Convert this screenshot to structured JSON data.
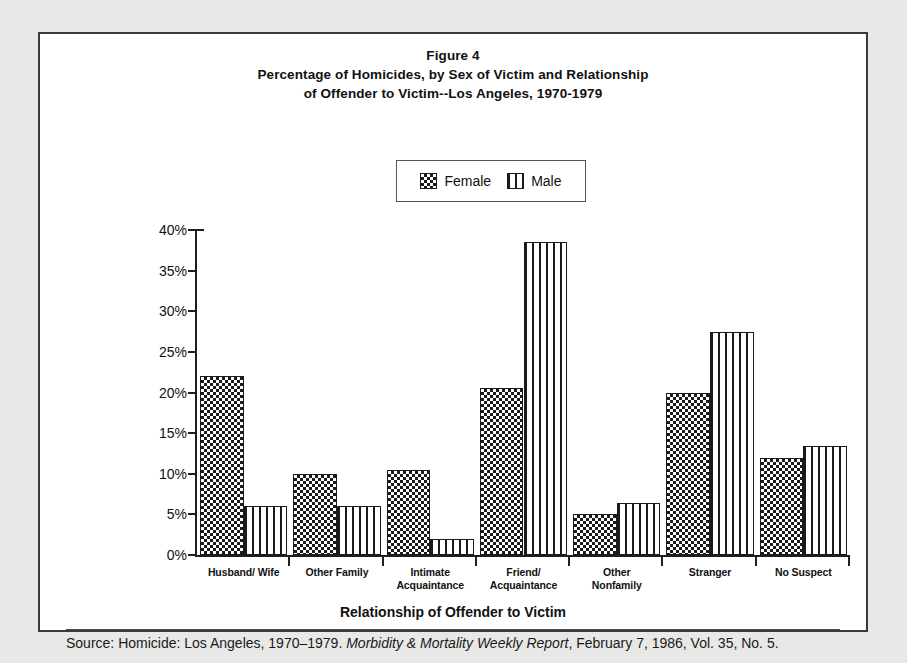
{
  "figure": {
    "title_lines": [
      "Figure 4",
      "Percentage of Homicides, by Sex of Victim and Relationship",
      "of Offender to Victim--Los Angeles, 1970-1979"
    ],
    "xaxis_title": "Relationship of Offender to Victim",
    "source_prefix": "Source: Homicide: Los Angeles, 1970–1979. ",
    "source_italic": "Morbidity & Mortality Weekly Report",
    "source_suffix": ", February 7, 1986, Vol. 35, No. 5."
  },
  "legend": {
    "female_label": "Female",
    "male_label": "Male",
    "female_swatch": "checkerboard-swatch",
    "male_swatch": "vertical-stripe-swatch"
  },
  "chart_data": {
    "type": "bar",
    "xlabel": "Relationship of Offender to Victim",
    "ylabel": "",
    "ylim": [
      0,
      40
    ],
    "ytick_values": [
      0,
      5,
      10,
      15,
      20,
      25,
      30,
      35,
      40
    ],
    "ytick_labels": [
      "0%",
      "5%",
      "10%",
      "15%",
      "20%",
      "25%",
      "30%",
      "35%",
      "40%"
    ],
    "grid": false,
    "legend_position": "top-center",
    "categories": [
      "Husband/ Wife",
      "Other Family",
      "Intimate Acquaintance",
      "Friend/ Acquaintance",
      "Other Nonfamily",
      "Stranger",
      "No Suspect"
    ],
    "category_label_lines": [
      [
        "Husband/ Wife"
      ],
      [
        "Other Family"
      ],
      [
        "Intimate",
        "Acquaintance"
      ],
      [
        "Friend/",
        "Acquaintance"
      ],
      [
        "Other",
        "Nonfamily"
      ],
      [
        "Stranger"
      ],
      [
        "No Suspect"
      ]
    ],
    "series": [
      {
        "name": "Female",
        "pattern": "checkerboard",
        "values": [
          22.0,
          10.0,
          10.5,
          20.5,
          5.0,
          20.0,
          12.0
        ]
      },
      {
        "name": "Male",
        "pattern": "vertical-stripes",
        "values": [
          6.0,
          6.0,
          2.0,
          38.5,
          6.4,
          27.5,
          13.4
        ]
      }
    ]
  }
}
